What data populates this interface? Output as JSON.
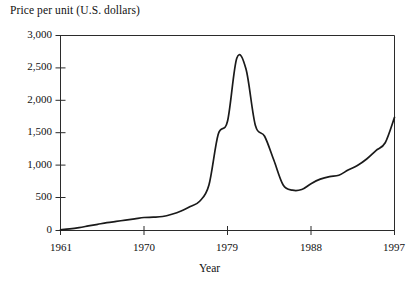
{
  "chart_data": {
    "type": "line",
    "title": "Price per unit (U.S. dollars)",
    "xlabel": "Year",
    "ylabel": "Price per unit (U.S. dollars)",
    "xlim": [
      1961,
      1997
    ],
    "ylim": [
      0,
      3000
    ],
    "grid": false,
    "legend": null,
    "xticks": [
      1961,
      1970,
      1979,
      1988,
      1997
    ],
    "xtick_labels": [
      "1961",
      "1970",
      "1979",
      "1988",
      "1997"
    ],
    "yticks": [
      0,
      500,
      1000,
      1500,
      2000,
      2500,
      3000
    ],
    "ytick_labels": [
      "0",
      "500",
      "1,000",
      "1,500",
      "2,000",
      "2,500",
      "3,000"
    ],
    "line_color": "#1a1a1a",
    "x": [
      1961,
      1962,
      1963,
      1964,
      1965,
      1966,
      1967,
      1968,
      1969,
      1970,
      1971,
      1972,
      1973,
      1974,
      1975,
      1976,
      1977,
      1978,
      1979,
      1980,
      1981,
      1982,
      1983,
      1984,
      1985,
      1986,
      1987,
      1988,
      1989,
      1990,
      1991,
      1992,
      1993,
      1994,
      1995,
      1996,
      1997
    ],
    "values": [
      10,
      25,
      45,
      70,
      95,
      120,
      140,
      160,
      180,
      200,
      205,
      215,
      250,
      300,
      370,
      450,
      700,
      1480,
      1680,
      2650,
      2480,
      1620,
      1450,
      1080,
      700,
      620,
      630,
      720,
      790,
      830,
      850,
      930,
      1000,
      1100,
      1230,
      1350,
      1740
    ],
    "series": [
      {
        "name": "Price per unit",
        "values": [
          10,
          25,
          45,
          70,
          95,
          120,
          140,
          160,
          180,
          200,
          205,
          215,
          250,
          300,
          370,
          450,
          700,
          1480,
          1680,
          2650,
          2480,
          1620,
          1450,
          1080,
          700,
          620,
          630,
          720,
          790,
          830,
          850,
          930,
          1000,
          1100,
          1230,
          1350,
          1740
        ]
      }
    ],
    "annotations": []
  },
  "axes": {
    "ytick_labels": [
      "3,000",
      "2,500",
      "2,000",
      "1,500",
      "1,000",
      "500",
      "0"
    ],
    "xtick_labels": [
      "1961",
      "1970",
      "1979",
      "1988",
      "1997"
    ]
  }
}
